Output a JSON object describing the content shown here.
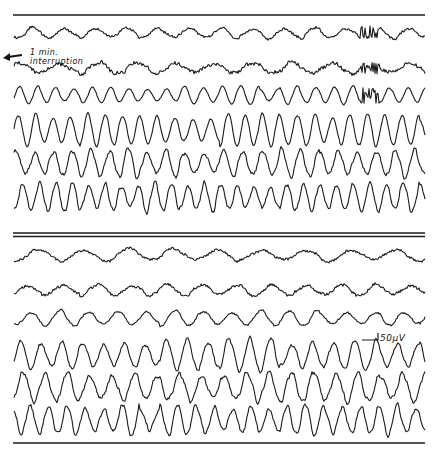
{
  "figure": {
    "annotation": {
      "line1": "1 min.",
      "line2": "interruption",
      "arrow": "left-arrow"
    },
    "scale_bar": {
      "label": "50µV",
      "x1": 362,
      "x2": 378,
      "y": 340
    },
    "rules": [
      {
        "y": 15,
        "x1": 13,
        "x2": 425,
        "w": 1.6
      },
      {
        "y": 233,
        "x1": 13,
        "x2": 425,
        "w": 1.6
      },
      {
        "y": 236.5,
        "x1": 13,
        "x2": 425,
        "w": 1.6
      },
      {
        "y": 443,
        "x1": 13,
        "x2": 425,
        "w": 1.4
      }
    ],
    "panels": [
      {
        "name": "before-interruption",
        "channels": [
          {
            "y": 33,
            "amp": 5,
            "freq": 0.2,
            "noise": 0.6,
            "break": 360
          },
          {
            "y": 68,
            "amp": 5,
            "freq": 0.16,
            "noise": 0.9,
            "break": 360
          },
          {
            "y": 95,
            "amp": 8,
            "freq": 0.34,
            "noise": 0.2,
            "break": 360
          },
          {
            "y": 130,
            "amp": 14,
            "freq": 0.36,
            "noise": 0.25,
            "break": 0
          },
          {
            "y": 163,
            "amp": 13,
            "freq": 0.33,
            "noise": 0.6,
            "break": 0
          },
          {
            "y": 197,
            "amp": 13,
            "freq": 0.38,
            "noise": 0.6,
            "break": 0
          }
        ]
      },
      {
        "name": "after-interruption",
        "channels": [
          {
            "y": 255,
            "amp": 6,
            "freq": 0.14,
            "noise": 0.6,
            "break": 0
          },
          {
            "y": 290,
            "amp": 5,
            "freq": 0.18,
            "noise": 0.7,
            "break": 0
          },
          {
            "y": 318,
            "amp": 7,
            "freq": 0.22,
            "noise": 0.4,
            "break": 0
          },
          {
            "y": 355,
            "amp": 14,
            "freq": 0.3,
            "noise": 0.5,
            "break": 0
          },
          {
            "y": 387,
            "amp": 13,
            "freq": 0.28,
            "noise": 0.7,
            "break": 0
          },
          {
            "y": 420,
            "amp": 14,
            "freq": 0.34,
            "noise": 0.6,
            "break": 0
          }
        ]
      }
    ],
    "trace_x_start": 14,
    "trace_x_end": 425,
    "ink_color": "#1a1a1a"
  }
}
